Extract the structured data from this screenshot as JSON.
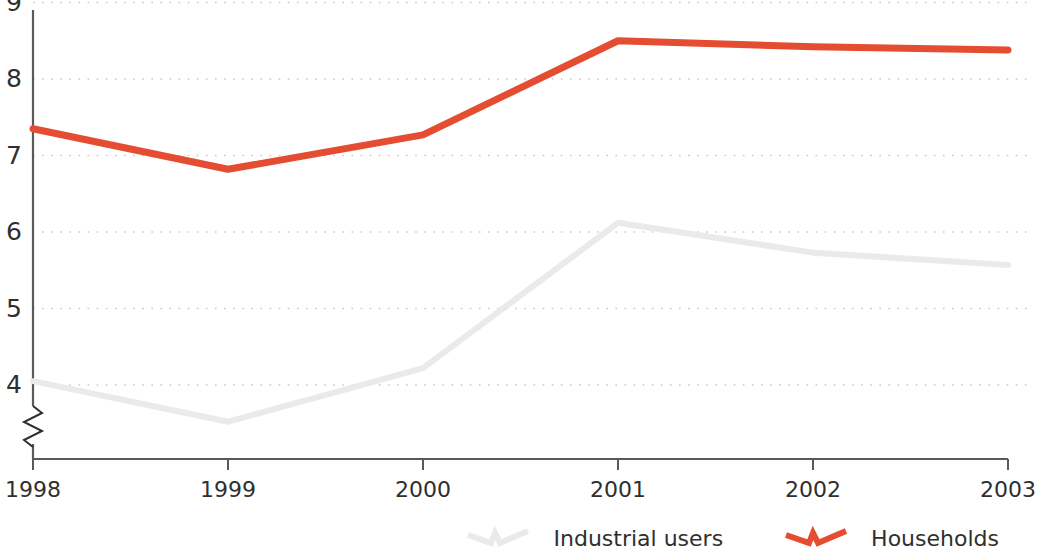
{
  "chart_data": {
    "type": "line",
    "title": "",
    "subtitle": "",
    "xlabel": "",
    "ylabel": "",
    "categories": [
      "1998",
      "1999",
      "2000",
      "2001",
      "2002",
      "2003"
    ],
    "x_tick_labels": [
      "1998",
      "1999",
      "2000",
      "2001",
      "2002",
      "2003"
    ],
    "y_tick_labels": [
      "4",
      "5",
      "6",
      "7",
      "8",
      "9"
    ],
    "ylim": [
      3.4,
      9.0
    ],
    "y_axis_break": true,
    "grid": "horizontal-dotted",
    "legend_position": "bottom-right",
    "series": [
      {
        "name": "Industrial users",
        "color": "#e9eaec",
        "values": [
          4.05,
          3.52,
          4.22,
          6.12,
          5.73,
          5.57
        ]
      },
      {
        "name": "Households",
        "color": "#e44d31",
        "values": [
          7.35,
          6.82,
          7.27,
          8.5,
          8.42,
          8.38
        ]
      }
    ]
  },
  "legend": {
    "items": [
      {
        "label": "Industrial users",
        "marker": "zigzag-line-marker",
        "color": "#e9eaec"
      },
      {
        "label": "Households",
        "marker": "zigzag-line-marker",
        "color": "#e44d31"
      }
    ]
  },
  "axes": {
    "y_ticks": [
      "9",
      "8",
      "7",
      "6",
      "5",
      "4"
    ],
    "x_ticks": [
      "1998",
      "1999",
      "2000",
      "2001",
      "2002",
      "2003"
    ],
    "axis_color": "#5a5a5a",
    "gridline_color": "#c9c9c9",
    "break_symbol": "zigzag"
  }
}
